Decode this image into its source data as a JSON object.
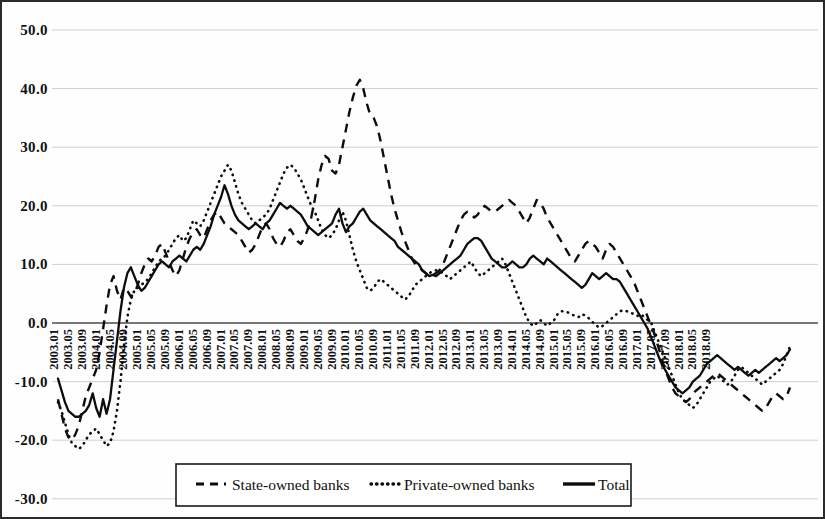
{
  "chart_data": {
    "type": "line",
    "title": "",
    "subtitle": "",
    "xlabel": "",
    "ylabel": "",
    "ylim": [
      -30.0,
      50.0
    ],
    "y_ticks": [
      "50.0",
      "40.0",
      "30.0",
      "20.0",
      "10.0",
      "0.0",
      "-10.0",
      "-20.0",
      "-30.0"
    ],
    "y_tick_values": [
      50.0,
      40.0,
      30.0,
      20.0,
      10.0,
      0.0,
      -10.0,
      -20.0,
      -30.0
    ],
    "grid": true,
    "legend_position": "bottom-center",
    "x_tick_labels": [
      "2003.01",
      "2003.05",
      "2003.09",
      "2004.01",
      "2004.05",
      "2004.09",
      "2005.01",
      "2005.05",
      "2005.09",
      "2006.01",
      "2006.05",
      "2006.09",
      "2007.01",
      "2007.05",
      "2007.09",
      "2008.01",
      "2008.05",
      "2008.09",
      "2009.01",
      "2009.05",
      "2009.09",
      "2010.01",
      "2010.05",
      "2010.09",
      "2011.01",
      "2011.05",
      "2011.09",
      "2012.01",
      "2012.05",
      "2012.09",
      "2013.01",
      "2013.05",
      "2013.09",
      "2014.01",
      "2014.05",
      "2014.09",
      "2015.01",
      "2015.05",
      "2015.09",
      "2016.01",
      "2016.05",
      "2016.09",
      "2017.01",
      "2017.05",
      "2017.09",
      "2018.01",
      "2018.05",
      "2018.09"
    ],
    "x_tick_interval_months": 4,
    "x_start": "2003.01",
    "x_end": "2018.11",
    "series": [
      {
        "name": "State-owned banks",
        "style": "dashed",
        "color": "#0d0d0d",
        "values": [
          -13.0,
          -15.5,
          -18.0,
          -19.5,
          -20.0,
          -19.0,
          -17.5,
          -15.0,
          -12.5,
          -11.0,
          -9.5,
          -8.0,
          -5.0,
          -1.0,
          3.0,
          6.5,
          8.0,
          5.5,
          4.0,
          6.0,
          5.5,
          4.5,
          5.0,
          6.5,
          8.5,
          10.0,
          11.0,
          10.5,
          11.5,
          13.0,
          13.5,
          12.0,
          10.5,
          9.0,
          8.0,
          9.0,
          11.0,
          13.0,
          14.5,
          15.5,
          16.0,
          15.0,
          14.5,
          16.0,
          17.5,
          18.5,
          19.0,
          18.0,
          17.0,
          16.5,
          16.0,
          15.5,
          15.0,
          14.0,
          13.0,
          12.0,
          12.5,
          13.5,
          15.0,
          16.5,
          17.0,
          16.0,
          14.5,
          13.5,
          13.0,
          14.0,
          15.5,
          16.0,
          15.0,
          14.0,
          13.5,
          14.5,
          16.0,
          18.0,
          21.0,
          24.5,
          27.0,
          28.5,
          28.0,
          26.0,
          25.5,
          27.0,
          30.0,
          33.0,
          36.0,
          38.5,
          40.5,
          41.5,
          40.0,
          37.5,
          35.5,
          35.0,
          33.5,
          31.0,
          28.0,
          25.0,
          22.0,
          19.5,
          17.5,
          15.5,
          14.0,
          12.5,
          11.0,
          10.0,
          9.5,
          9.0,
          8.5,
          8.0,
          8.2,
          8.5,
          9.0,
          10.0,
          11.5,
          13.0,
          14.5,
          16.0,
          17.5,
          18.5,
          19.0,
          18.5,
          18.0,
          18.5,
          19.5,
          20.0,
          19.5,
          19.0,
          19.0,
          19.5,
          20.0,
          20.5,
          21.0,
          20.5,
          20.0,
          19.0,
          18.0,
          17.0,
          18.0,
          19.5,
          21.0,
          20.5,
          19.5,
          18.0,
          17.0,
          16.0,
          15.0,
          14.0,
          13.0,
          12.0,
          11.0,
          10.5,
          11.5,
          12.5,
          13.5,
          14.0,
          13.5,
          13.0,
          12.0,
          11.0,
          12.5,
          13.5,
          13.0,
          12.0,
          11.0,
          10.0,
          9.0,
          8.0,
          7.0,
          5.5,
          4.0,
          2.5,
          1.0,
          -0.5,
          -2.0,
          -4.0,
          -6.0,
          -8.0,
          -9.5,
          -11.0,
          -12.0,
          -12.5,
          -13.0,
          -13.5,
          -13.0,
          -12.0,
          -11.5,
          -11.0,
          -10.5,
          -10.0,
          -9.5,
          -9.0,
          -8.5,
          -9.0,
          -9.5,
          -10.0,
          -10.5,
          -11.0,
          -11.5,
          -12.0,
          -12.5,
          -13.0,
          -13.5,
          -14.0,
          -14.5,
          -15.0,
          -14.5,
          -13.5,
          -12.5,
          -12.0,
          -12.5,
          -13.0,
          -12.5,
          -11.0
        ]
      },
      {
        "name": "Private-owned banks",
        "style": "dotted",
        "color": "#0d0d0d",
        "values": [
          -13.5,
          -15.0,
          -17.0,
          -19.0,
          -20.5,
          -21.0,
          -21.5,
          -21.0,
          -20.0,
          -19.0,
          -18.5,
          -18.0,
          -19.0,
          -20.0,
          -21.0,
          -20.5,
          -18.5,
          -15.0,
          -10.0,
          -4.0,
          1.0,
          4.0,
          5.5,
          6.0,
          6.5,
          7.0,
          7.5,
          8.5,
          9.5,
          10.5,
          11.0,
          11.5,
          12.5,
          13.5,
          14.5,
          15.0,
          14.0,
          14.5,
          16.0,
          17.5,
          17.0,
          16.5,
          17.5,
          19.0,
          20.5,
          22.0,
          23.5,
          25.0,
          26.0,
          27.0,
          26.0,
          24.0,
          22.0,
          20.5,
          19.5,
          18.5,
          17.5,
          17.0,
          17.5,
          18.0,
          18.5,
          19.5,
          21.0,
          22.5,
          24.0,
          25.5,
          26.5,
          27.0,
          26.5,
          25.5,
          24.5,
          23.0,
          21.5,
          20.0,
          19.0,
          17.5,
          16.0,
          15.0,
          14.5,
          15.0,
          16.0,
          17.5,
          19.0,
          17.5,
          15.0,
          12.5,
          10.5,
          9.0,
          7.5,
          6.0,
          5.5,
          6.0,
          7.0,
          7.5,
          7.0,
          6.5,
          6.0,
          5.5,
          5.0,
          4.5,
          4.0,
          4.5,
          5.5,
          6.5,
          7.0,
          7.5,
          8.0,
          8.5,
          8.8,
          9.0,
          8.8,
          8.5,
          8.0,
          7.5,
          8.0,
          8.5,
          9.0,
          9.5,
          10.0,
          10.5,
          9.5,
          8.5,
          8.0,
          8.5,
          9.0,
          9.5,
          10.0,
          10.5,
          11.0,
          10.0,
          8.5,
          7.0,
          5.5,
          4.0,
          2.5,
          1.0,
          0.0,
          -0.5,
          0.0,
          0.5,
          0.0,
          -0.5,
          0.0,
          0.5,
          1.5,
          2.0,
          2.0,
          1.8,
          1.5,
          1.2,
          1.0,
          1.5,
          1.3,
          0.8,
          0.2,
          -0.3,
          -0.8,
          -0.5,
          0.0,
          0.5,
          1.0,
          1.5,
          2.0,
          2.2,
          2.0,
          1.8,
          1.5,
          1.2,
          1.5,
          1.0,
          0.5,
          0.0,
          -1.5,
          -3.0,
          -4.5,
          -6.0,
          -7.5,
          -9.0,
          -10.5,
          -12.0,
          -13.0,
          -13.5,
          -14.0,
          -14.5,
          -14.0,
          -13.0,
          -12.0,
          -11.0,
          -10.0,
          -9.5,
          -9.0,
          -9.5,
          -10.0,
          -10.5,
          -10.0,
          -9.0,
          -8.0,
          -7.5,
          -8.0,
          -8.5,
          -9.0,
          -9.5,
          -10.0,
          -10.5,
          -10.0,
          -9.5,
          -9.0,
          -8.5,
          -8.0,
          -7.0,
          -5.5,
          -4.0
        ]
      },
      {
        "name": "Total",
        "style": "solid",
        "color": "#0d0d0d",
        "values": [
          -9.5,
          -11.5,
          -13.5,
          -15.0,
          -15.5,
          -16.0,
          -16.0,
          -15.5,
          -15.0,
          -14.0,
          -12.0,
          -14.5,
          -16.0,
          -13.0,
          -15.5,
          -13.0,
          -8.0,
          -3.0,
          2.0,
          6.0,
          8.5,
          9.5,
          8.0,
          6.5,
          5.5,
          6.0,
          7.0,
          8.0,
          9.0,
          10.0,
          10.5,
          10.0,
          9.5,
          10.5,
          11.0,
          11.5,
          11.0,
          10.5,
          11.5,
          12.5,
          13.0,
          12.5,
          13.5,
          15.0,
          16.5,
          18.5,
          20.0,
          21.5,
          23.5,
          22.0,
          20.0,
          18.5,
          17.5,
          17.0,
          16.5,
          16.0,
          16.5,
          17.0,
          16.5,
          16.0,
          17.0,
          17.5,
          18.5,
          19.5,
          20.5,
          20.0,
          19.5,
          20.0,
          19.5,
          19.0,
          18.5,
          17.5,
          16.5,
          16.0,
          15.5,
          15.0,
          15.5,
          16.0,
          16.5,
          17.0,
          18.5,
          19.5,
          17.0,
          15.5,
          16.5,
          17.0,
          18.0,
          19.0,
          19.5,
          18.5,
          17.5,
          17.0,
          16.5,
          16.0,
          15.5,
          15.0,
          14.5,
          14.0,
          13.0,
          12.5,
          12.0,
          11.5,
          11.0,
          10.5,
          10.0,
          9.0,
          8.5,
          8.0,
          8.2,
          8.0,
          8.5,
          9.0,
          9.5,
          10.0,
          10.5,
          11.0,
          11.5,
          12.5,
          13.5,
          14.0,
          14.5,
          14.5,
          14.0,
          13.0,
          12.0,
          11.0,
          10.5,
          10.0,
          9.5,
          9.5,
          10.0,
          10.5,
          10.0,
          9.5,
          9.5,
          10.0,
          11.0,
          11.5,
          11.0,
          10.5,
          10.0,
          11.0,
          10.5,
          10.0,
          9.5,
          9.0,
          8.5,
          8.0,
          7.5,
          7.0,
          6.5,
          6.0,
          6.5,
          7.5,
          8.5,
          8.0,
          7.5,
          8.0,
          8.5,
          8.0,
          7.5,
          7.5,
          7.0,
          6.0,
          5.0,
          4.0,
          3.0,
          2.0,
          1.0,
          0.0,
          -1.0,
          -2.5,
          -4.0,
          -5.5,
          -7.0,
          -8.0,
          -9.0,
          -10.0,
          -11.0,
          -11.5,
          -12.0,
          -11.5,
          -11.0,
          -10.0,
          -9.5,
          -9.0,
          -8.0,
          -7.0,
          -6.5,
          -6.0,
          -5.5,
          -6.0,
          -6.5,
          -7.0,
          -7.5,
          -8.0,
          -7.5,
          -8.0,
          -8.5,
          -9.0,
          -8.5,
          -8.0,
          -8.5,
          -8.0,
          -7.5,
          -7.0,
          -6.5,
          -6.0,
          -6.5,
          -6.0,
          -5.5,
          -4.5
        ]
      }
    ],
    "legend": [
      {
        "label": "State-owned banks",
        "style": "dashed"
      },
      {
        "label": "Private-owned banks",
        "style": "dotted"
      },
      {
        "label": "Total",
        "style": "solid"
      }
    ]
  }
}
